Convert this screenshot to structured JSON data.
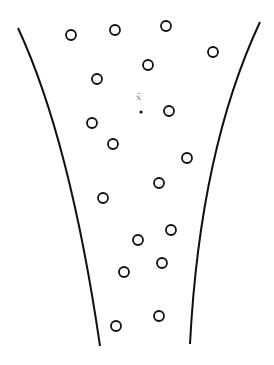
{
  "diagram": {
    "stroke_color": "#111111",
    "background": "#ffffff",
    "center_label": "x̄",
    "left_curve": {
      "start": [
        18,
        28
      ],
      "control": [
        70,
        140
      ],
      "end": [
        100,
        346
      ]
    },
    "right_curve": {
      "start": [
        260,
        22
      ],
      "control": [
        200,
        150
      ],
      "end": [
        190,
        344
      ]
    },
    "center_point": [
      141,
      112
    ],
    "circles": [
      [
        71,
        35
      ],
      [
        115,
        30
      ],
      [
        166,
        26
      ],
      [
        213,
        52
      ],
      [
        148,
        65
      ],
      [
        97,
        79
      ],
      [
        169,
        111
      ],
      [
        92,
        123
      ],
      [
        113,
        144
      ],
      [
        187,
        158
      ],
      [
        159,
        183
      ],
      [
        103,
        198
      ],
      [
        171,
        230
      ],
      [
        138,
        240
      ],
      [
        162,
        263
      ],
      [
        124,
        272
      ],
      [
        159,
        316
      ],
      [
        116,
        326
      ]
    ],
    "circle_radius": 5
  }
}
